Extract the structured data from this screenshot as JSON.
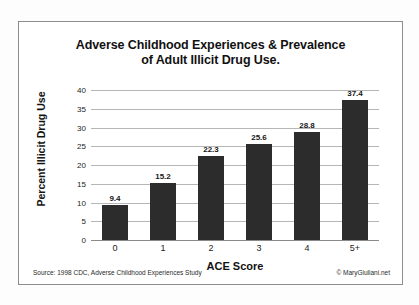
{
  "chart_data": {
    "type": "bar",
    "title": "Adverse Childhood Experiences & Prevalence of Adult Illicit Drug Use.",
    "title_line1": "Adverse Childhood Experiences & Prevalence",
    "title_line2": "of Adult Illicit Drug Use.",
    "xlabel": "ACE Score",
    "ylabel": "Percent Illicit Drug Use",
    "categories": [
      "0",
      "1",
      "2",
      "3",
      "4",
      "5+"
    ],
    "values": [
      9.4,
      15.2,
      22.3,
      25.6,
      28.8,
      37.4
    ],
    "value_labels": [
      "9.4",
      "15.2",
      "22.3",
      "25.6",
      "28.8",
      "37.4"
    ],
    "ylim": [
      0,
      40
    ],
    "yticks": [
      40,
      35,
      30,
      25,
      20,
      15,
      10,
      5,
      0
    ],
    "ytick_labels": [
      "40",
      "35",
      "30",
      "25",
      "20",
      "15",
      "10",
      "5",
      "0"
    ],
    "grid": true,
    "legend": false,
    "bar_color": "#2c2c2c",
    "grid_color": "#b6b6b6"
  },
  "footer": {
    "source": "Source: 1998 CDC, Adverse Childhood Experiences Study",
    "credit": "© MaryGiuliani.net"
  }
}
